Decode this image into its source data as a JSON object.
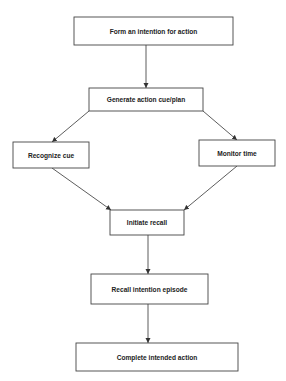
{
  "diagram": {
    "type": "flowchart",
    "nodes": [
      {
        "id": "form-intention",
        "label": "Form an intention for action"
      },
      {
        "id": "generate-cue",
        "label": "Generate action cue/plan"
      },
      {
        "id": "recognize-cue",
        "label": "Recognize cue"
      },
      {
        "id": "monitor-time",
        "label": "Monitor time"
      },
      {
        "id": "initiate-recall",
        "label": "Initiate recall"
      },
      {
        "id": "recall-episode",
        "label": "Recall intention episode"
      },
      {
        "id": "complete-action",
        "label": "Complete intended action"
      }
    ],
    "edges": [
      {
        "from": "form-intention",
        "to": "generate-cue"
      },
      {
        "from": "generate-cue",
        "to": "recognize-cue"
      },
      {
        "from": "generate-cue",
        "to": "monitor-time"
      },
      {
        "from": "recognize-cue",
        "to": "initiate-recall"
      },
      {
        "from": "monitor-time",
        "to": "initiate-recall"
      },
      {
        "from": "initiate-recall",
        "to": "recall-episode"
      },
      {
        "from": "recall-episode",
        "to": "complete-action"
      }
    ],
    "colors": {
      "line": "#333333",
      "box_border": "#444444",
      "text": "#222222",
      "background": "#ffffff"
    }
  }
}
